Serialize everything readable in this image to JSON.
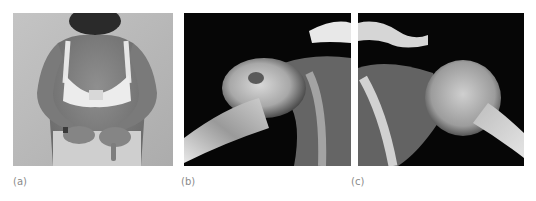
{
  "figure": {
    "panels": [
      {
        "label": "(a)",
        "description": "photograph of patient from behind, hands behind back with deformed fingers"
      },
      {
        "label": "(b)",
        "description": "shoulder x-ray, right"
      },
      {
        "label": "(c)",
        "description": "shoulder x-ray, left"
      }
    ]
  }
}
